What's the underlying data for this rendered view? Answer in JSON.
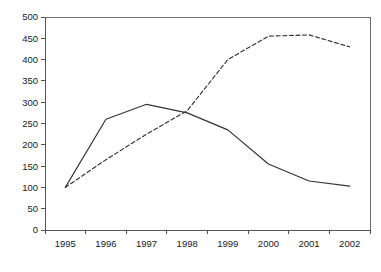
{
  "chart_data": {
    "type": "line",
    "title": "",
    "subtitle": "",
    "xlabel": "",
    "ylabel": "",
    "categories": [
      "1995",
      "1996",
      "1997",
      "1998",
      "1999",
      "2000",
      "2001",
      "2002"
    ],
    "x": [
      1995,
      1996,
      1997,
      1998,
      1999,
      2000,
      2001,
      2002
    ],
    "series": [
      {
        "name": "solid-series",
        "style": "solid",
        "color": "#333333",
        "values": [
          100,
          260,
          295,
          275,
          235,
          155,
          115,
          103
        ]
      },
      {
        "name": "dashed-series",
        "style": "dashed",
        "color": "#333333",
        "values": [
          100,
          165,
          225,
          280,
          400,
          455,
          458,
          430
        ]
      }
    ],
    "ylim": [
      0,
      500
    ],
    "yticks": [
      0,
      50,
      100,
      150,
      200,
      250,
      300,
      350,
      400,
      450,
      500
    ],
    "ytick_labels": [
      "0",
      "50",
      "100",
      "150",
      "200",
      "250",
      "300",
      "350",
      "400",
      "450",
      "500"
    ],
    "xtick_labels": [
      "1995",
      "1996",
      "1997",
      "1998",
      "1999",
      "2000",
      "2001",
      "2002"
    ],
    "grid": false,
    "legend": "none",
    "annotations": []
  },
  "plot": {
    "left": 45,
    "right": 370,
    "top": 17,
    "bottom": 230
  }
}
